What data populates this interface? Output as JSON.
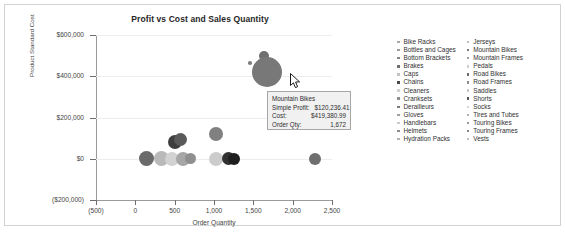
{
  "chart_title": "Profit vs Cost and Sales Quantity",
  "axis": {
    "x_title": "Order Quantity",
    "y_title": "Product Standard Cost",
    "x_ticks": [
      "(500)",
      "0",
      "500",
      "1,000",
      "1,500",
      "2,000",
      "2,500"
    ],
    "y_ticks": [
      "$600,000",
      "$400,000",
      "$200,000",
      "$0",
      "($200,000)"
    ]
  },
  "tooltip": {
    "title": "Mountain Bikes",
    "profit_label": "Simple Profit:",
    "profit_value": "$120,236.41",
    "cost_label": "Cost:",
    "cost_value": "$419,380.99",
    "qty_label": "Order Qty:",
    "qty_value": "1,672"
  },
  "legend": {
    "col1": [
      {
        "label": "Bike Racks",
        "color": "#a8a8a8"
      },
      {
        "label": "Bottles and Cages",
        "color": "#9b9b9b"
      },
      {
        "label": "Bottom Brackets",
        "color": "#858585"
      },
      {
        "label": "Brakes",
        "color": "#6f6f6f"
      },
      {
        "label": "Caps",
        "color": "#c4c4c4"
      },
      {
        "label": "Chains",
        "color": "#4a4a4a"
      },
      {
        "label": "Cleaners",
        "color": "#d0d0d0"
      },
      {
        "label": "Cranksets",
        "color": "#8e8e8e"
      },
      {
        "label": "Derailleurs",
        "color": "#7b7b7b"
      },
      {
        "label": "Gloves",
        "color": "#9f9f9f"
      },
      {
        "label": "Handlebars",
        "color": "#c9c9c9"
      },
      {
        "label": "Helmets",
        "color": "#8a8a8a"
      },
      {
        "label": "Hydration Packs",
        "color": "#b4b4b4"
      }
    ],
    "col2": [
      {
        "label": "Jerseys",
        "color": "#bdbdbd"
      },
      {
        "label": "Mountain Bikes",
        "color": "#7a7a7a"
      },
      {
        "label": "Mountain Frames",
        "color": "#a0a0a0"
      },
      {
        "label": "Pedals",
        "color": "#cfcfcf"
      },
      {
        "label": "Road Bikes",
        "color": "#6b6b6b"
      },
      {
        "label": "Road Frames",
        "color": "#8c8c8c"
      },
      {
        "label": "Saddles",
        "color": "#c6c6c6"
      },
      {
        "label": "Shorts",
        "color": "#565656"
      },
      {
        "label": "Socks",
        "color": "#d4d4d4"
      },
      {
        "label": "Tires and Tubes",
        "color": "#b0b0b0"
      },
      {
        "label": "Touring Bikes",
        "color": "#989898"
      },
      {
        "label": "Touring Frames",
        "color": "#848484"
      },
      {
        "label": "Vests",
        "color": "#c2c2c2"
      }
    ]
  },
  "chart_data": {
    "type": "scatter",
    "title": "Profit vs Cost and Sales Quantity",
    "xlabel": "Order Quantity",
    "ylabel": "Product Standard Cost",
    "xlim": [
      -500,
      2500
    ],
    "ylim": [
      -200000,
      600000
    ],
    "grid": true,
    "legend_position": "right",
    "size_encoding": "Simple Profit",
    "points": [
      {
        "name": "Bike Racks",
        "x": 140,
        "y": 0,
        "r": 7.5,
        "color": "#6a6a6a"
      },
      {
        "name": "Bottles and Cages",
        "x": 330,
        "y": 0,
        "r": 7.5,
        "color": "#b9b9b9"
      },
      {
        "name": "Bottom Brackets",
        "x": 470,
        "y": 0,
        "r": 7.0,
        "color": "#d2d2d2"
      },
      {
        "name": "Brakes",
        "x": 600,
        "y": 0,
        "r": 7.0,
        "color": "#a6a6a6"
      },
      {
        "name": "Caps",
        "x": 700,
        "y": 0,
        "r": 5.5,
        "color": "#8f8f8f"
      },
      {
        "name": "Chains",
        "x": 500,
        "y": 80000,
        "r": 7.0,
        "color": "#3f3f3f"
      },
      {
        "name": "Cleaners",
        "x": 570,
        "y": 95000,
        "r": 6.5,
        "color": "#5a5a5a"
      },
      {
        "name": "Cranksets",
        "x": 1030,
        "y": 118000,
        "r": 7.0,
        "color": "#808080"
      },
      {
        "name": "Derailleurs",
        "x": 1030,
        "y": 0,
        "r": 7.0,
        "color": "#cccccc"
      },
      {
        "name": "Gloves",
        "x": 1180,
        "y": 0,
        "r": 6.5,
        "color": "#313131"
      },
      {
        "name": "Helmets",
        "x": 1260,
        "y": 0,
        "r": 6.0,
        "color": "#1f1f1f"
      },
      {
        "name": "Jerseys",
        "x": 1460,
        "y": 465000,
        "r": 1.8,
        "color": "#7f7f7f"
      },
      {
        "name": "Road Bikes",
        "x": 1640,
        "y": 500000,
        "r": 5.0,
        "color": "#707070"
      },
      {
        "name": "Mountain Bikes",
        "x": 1672,
        "y": 419381,
        "r": 15.0,
        "color": "#787878"
      },
      {
        "name": "Tires and Tubes",
        "x": 2290,
        "y": 0,
        "r": 6.0,
        "color": "#6e6e6e"
      }
    ]
  }
}
